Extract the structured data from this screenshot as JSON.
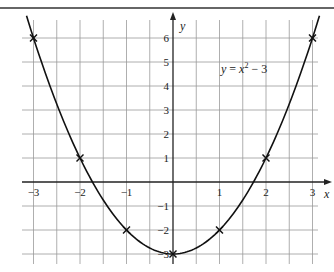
{
  "chart_data": {
    "type": "line",
    "title": "",
    "xlabel": "x",
    "ylabel": "y",
    "xlim": [
      -3,
      3
    ],
    "ylim": [
      -3,
      6
    ],
    "grid": true,
    "x_grid_step": 0.5,
    "y_grid_step": 1,
    "x_ticks": [
      -3,
      -2,
      -1,
      1,
      2,
      3
    ],
    "x_tick_labels": [
      "−3",
      "−2",
      "−1",
      "1",
      "2",
      "3"
    ],
    "y_ticks": [
      6,
      5,
      4,
      3,
      2,
      1,
      -1,
      -2,
      -3
    ],
    "y_tick_labels": [
      "6",
      "5",
      "4",
      "3",
      "2",
      "1",
      "−1",
      "−2",
      "−3"
    ],
    "series": [
      {
        "name": "y = x² − 3",
        "function": "x^2 - 3",
        "style": "curve",
        "color": "#111111"
      },
      {
        "name": "plotted points",
        "style": "cross-markers",
        "x": [
          -3,
          -2,
          -1,
          0,
          1,
          2,
          3
        ],
        "y": [
          6,
          1,
          -2,
          -3,
          -2,
          1,
          6
        ]
      }
    ],
    "annotation": {
      "lhs": "y",
      "eq": " = ",
      "var": "x",
      "exp": "2",
      "rest": " − 3"
    }
  },
  "colors": {
    "grid": "#9a9a9a",
    "axis": "#222222",
    "curve": "#111111",
    "border": "#333333"
  }
}
